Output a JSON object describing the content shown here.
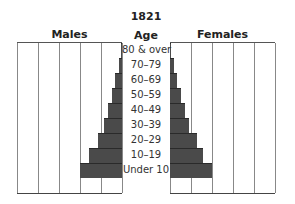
{
  "chart_data": {
    "type": "bar",
    "orientation": "horizontal",
    "subtype": "population-pyramid",
    "title": "1821",
    "center_label": "Age",
    "categories": [
      "80 & over",
      "70–79",
      "60–69",
      "50–59",
      "40–49",
      "30–39",
      "20–29",
      "10–19",
      "Under 10"
    ],
    "series": [
      {
        "name": "Males",
        "values": [
          0.05,
          0.15,
          0.33,
          0.48,
          0.65,
          0.85,
          1.15,
          1.55,
          2.0
        ]
      },
      {
        "name": "Females",
        "values": [
          0.05,
          0.2,
          0.33,
          0.5,
          0.7,
          0.9,
          1.3,
          1.55,
          2.0
        ]
      }
    ],
    "xlabel": "",
    "ylabel": "Age",
    "xlim": [
      0,
      5
    ],
    "ticks": [
      "0",
      "1",
      "2",
      "3",
      "4",
      "5"
    ],
    "grid": true,
    "bar_color": "#4a4a4a"
  },
  "labels": {
    "title": "1821",
    "age": "Age",
    "males": "Males",
    "females": "Females"
  }
}
